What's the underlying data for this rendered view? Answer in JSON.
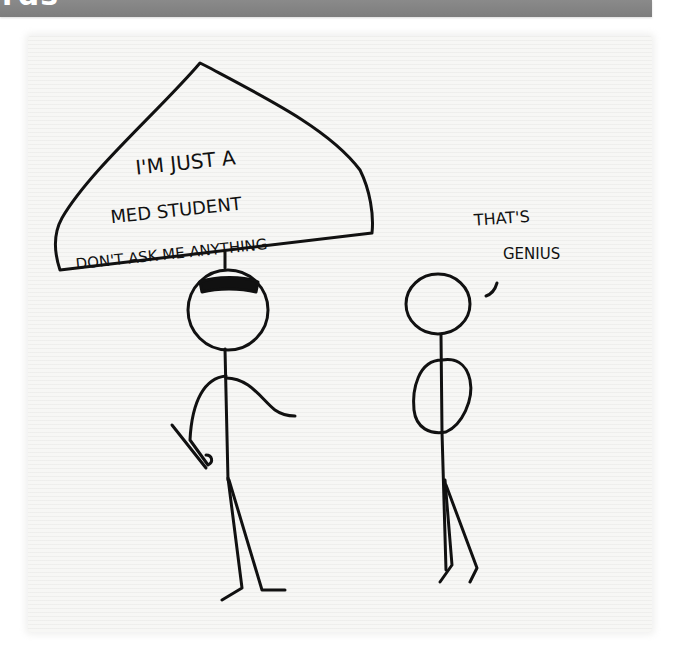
{
  "header": {
    "title_fragment": "rds"
  },
  "comic": {
    "sign_text": {
      "line1": "I'M JUST A",
      "line2": "MED STUDENT",
      "line3": "DON'T ASK ME ANYTHING"
    },
    "speech_text": {
      "line1": "THAT'S",
      "line2": "GENIUS"
    },
    "ink_color": "#111111",
    "paper_color": "#f7f7f5",
    "header_color": "#848484"
  }
}
